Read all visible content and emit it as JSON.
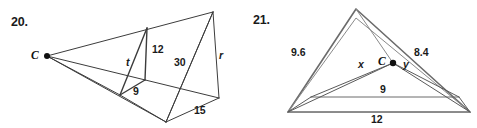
{
  "page": {
    "background_color": "#ffffff",
    "stroke_color": "#3c3c3c",
    "text_color": "#1a1a1a"
  },
  "figures": [
    {
      "number": "20.",
      "vertex_label": "C",
      "labels": [
        {
          "text": "t",
          "style": "italic"
        },
        {
          "text": "12",
          "style": "normal"
        },
        {
          "text": "9",
          "style": "normal"
        },
        {
          "text": "30",
          "style": "normal"
        },
        {
          "text": "r",
          "style": "italic"
        },
        {
          "text": "15",
          "style": "normal"
        }
      ]
    },
    {
      "number": "21.",
      "vertex_label": "C",
      "labels": [
        {
          "text": "9.6",
          "style": "normal"
        },
        {
          "text": "8.4",
          "style": "normal"
        },
        {
          "text": "x",
          "style": "italic"
        },
        {
          "text": "y",
          "style": "italic"
        },
        {
          "text": "9",
          "style": "normal"
        },
        {
          "text": "12",
          "style": "normal"
        }
      ]
    }
  ],
  "figure20": {
    "number": "20.",
    "center_label": "C",
    "side_t": "t",
    "side_12": "12",
    "side_9": "9",
    "side_30": "30",
    "side_r": "r",
    "side_15": "15"
  },
  "figure21": {
    "number": "21.",
    "center_label": "C",
    "side_96": "9.6",
    "side_84": "8.4",
    "side_x": "x",
    "side_y": "y",
    "side_9": "9",
    "side_12": "12"
  }
}
